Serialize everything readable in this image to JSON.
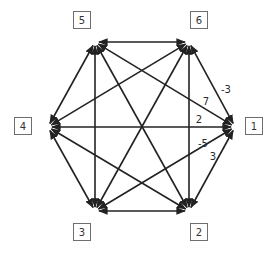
{
  "diagram": {
    "type": "complete-directed-graph",
    "colors": {
      "edge": "#222222",
      "node_border": "#6e6e6e",
      "text": "#333333",
      "background": "#ffffff"
    },
    "nodes": [
      {
        "id": "1",
        "label": "1",
        "box": [
          245,
          117
        ],
        "anchor": [
          235,
          127
        ]
      },
      {
        "id": "2",
        "label": "2",
        "box": [
          190,
          223
        ],
        "anchor": [
          189,
          211
        ]
      },
      {
        "id": "3",
        "label": "3",
        "box": [
          73,
          223
        ],
        "anchor": [
          95,
          211
        ]
      },
      {
        "id": "4",
        "label": "4",
        "box": [
          14,
          117
        ],
        "anchor": [
          48,
          127
        ]
      },
      {
        "id": "5",
        "label": "5",
        "box": [
          73,
          11
        ],
        "anchor": [
          95,
          42
        ]
      },
      {
        "id": "6",
        "label": "6",
        "box": [
          190,
          11
        ],
        "anchor": [
          189,
          42
        ]
      }
    ],
    "edges": [
      [
        "1",
        "2"
      ],
      [
        "1",
        "3"
      ],
      [
        "1",
        "4"
      ],
      [
        "1",
        "5"
      ],
      [
        "1",
        "6"
      ],
      [
        "2",
        "3"
      ],
      [
        "2",
        "4"
      ],
      [
        "2",
        "5"
      ],
      [
        "2",
        "6"
      ],
      [
        "3",
        "4"
      ],
      [
        "3",
        "5"
      ],
      [
        "3",
        "6"
      ],
      [
        "4",
        "5"
      ],
      [
        "4",
        "6"
      ],
      [
        "5",
        "6"
      ]
    ],
    "edge_labels": [
      {
        "from": "6",
        "to": "1",
        "label": "-3",
        "pos": [
          226,
          89
        ]
      },
      {
        "from": "5",
        "to": "1",
        "label": "7",
        "pos": [
          206,
          101
        ]
      },
      {
        "from": "4",
        "to": "1",
        "label": "2",
        "pos": [
          199,
          119
        ]
      },
      {
        "from": "3",
        "to": "1",
        "label": "-5",
        "pos": [
          203,
          143
        ]
      },
      {
        "from": "2",
        "to": "1",
        "label": "3",
        "pos": [
          213,
          156
        ]
      }
    ]
  }
}
